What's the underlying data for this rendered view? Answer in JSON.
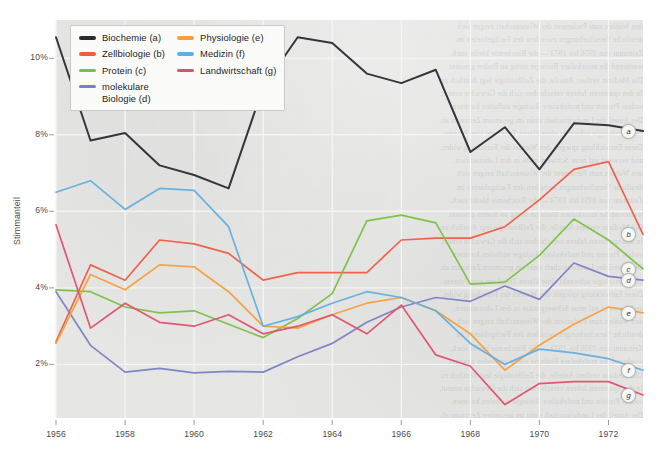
{
  "chart_data": {
    "type": "line",
    "title": "",
    "xlabel": "",
    "ylabel": "Stimmanteil",
    "xlim": [
      1956,
      1973
    ],
    "ylim": [
      0.6,
      11.0
    ],
    "grid": true,
    "legend_position": "top-left",
    "x_tick_labels": [
      "1956",
      "1958",
      "1960",
      "1962",
      "1964",
      "1966",
      "1968",
      "1970",
      "1972"
    ],
    "x_ticks": [
      1956,
      1958,
      1960,
      1962,
      1964,
      1966,
      1968,
      1970,
      1972
    ],
    "y_tick_labels": [
      "2%",
      "4%",
      "6%",
      "8%",
      "10%"
    ],
    "y_ticks": [
      2,
      4,
      6,
      8,
      10
    ],
    "x": [
      1956,
      1957,
      1958,
      1959,
      1960,
      1961,
      1962,
      1963,
      1964,
      1965,
      1966,
      1967,
      1968,
      1969,
      1970,
      1971,
      1972,
      1973
    ],
    "series": [
      {
        "name": "Biochemie (a)",
        "key": "a",
        "color": "#2b2b33",
        "values": [
          10.55,
          7.85,
          8.05,
          7.2,
          6.95,
          6.6,
          9.25,
          10.55,
          10.4,
          9.6,
          9.35,
          9.7,
          7.55,
          8.2,
          7.1,
          8.3,
          8.25,
          8.1
        ]
      },
      {
        "name": "Zellbiologie (b)",
        "key": "b",
        "color": "#ef5c45",
        "values": [
          2.6,
          4.6,
          4.2,
          5.25,
          5.15,
          4.9,
          4.2,
          4.4,
          4.4,
          4.4,
          5.25,
          5.3,
          5.3,
          5.6,
          6.3,
          7.1,
          7.3,
          5.4
        ]
      },
      {
        "name": "Protein (c)",
        "key": "c",
        "color": "#7bc043",
        "values": [
          3.95,
          3.9,
          3.5,
          3.35,
          3.4,
          3.05,
          2.7,
          3.2,
          3.85,
          5.75,
          5.9,
          5.7,
          4.1,
          4.15,
          4.85,
          5.8,
          5.25,
          4.5
        ]
      },
      {
        "name": "molekulare\nBiologie (d)",
        "key": "d",
        "color": "#7b7fc4",
        "values": [
          3.9,
          2.5,
          1.8,
          1.9,
          1.78,
          1.82,
          1.8,
          2.2,
          2.55,
          3.1,
          3.5,
          3.75,
          3.65,
          4.05,
          3.7,
          4.65,
          4.3,
          4.2
        ]
      },
      {
        "name": "Physiologie (e)",
        "key": "e",
        "color": "#f5a03c",
        "values": [
          2.55,
          4.35,
          3.95,
          4.6,
          4.55,
          3.9,
          3.0,
          2.95,
          3.3,
          3.6,
          3.75,
          3.4,
          2.8,
          1.85,
          2.5,
          3.05,
          3.5,
          3.35
        ]
      },
      {
        "name": "Medizin (f)",
        "key": "f",
        "color": "#62aee0",
        "values": [
          6.5,
          6.8,
          6.05,
          6.6,
          6.55,
          5.6,
          3.0,
          3.25,
          3.6,
          3.9,
          3.75,
          3.4,
          2.55,
          2.0,
          2.4,
          2.3,
          2.15,
          1.85
        ]
      },
      {
        "name": "Landwirtschaft (g)",
        "key": "g",
        "color": "#e0506b"
      }
    ]
  },
  "series_g_values": [
    5.65,
    2.95,
    3.6,
    3.1,
    3.0,
    3.3,
    2.8,
    3.0,
    3.3,
    2.8,
    3.55,
    2.25,
    1.95,
    0.95,
    1.5,
    1.55,
    1.55,
    1.2
  ],
  "legend": {
    "column_1": [
      {
        "label": "Biochemie (a)",
        "color": "#2b2b33"
      },
      {
        "label": "Zellbiologie (b)",
        "color": "#ef5c45"
      },
      {
        "label": "Protein (c)",
        "color": "#7bc043"
      },
      {
        "label": "molekulare\nBiologie (d)",
        "color": "#7b7fc4"
      }
    ],
    "column_2": [
      {
        "label": "Physiologie (e)",
        "color": "#f5a03c"
      },
      {
        "label": "Medizin (f)",
        "color": "#62aee0"
      },
      {
        "label": "Landwirtschaft (g)",
        "color": "#e0506b"
      }
    ]
  },
  "end_labels": [
    {
      "key": "a",
      "text": "a"
    },
    {
      "key": "b",
      "text": "b"
    },
    {
      "key": "c",
      "text": "c"
    },
    {
      "key": "d",
      "text": "d"
    },
    {
      "key": "e",
      "text": "e"
    },
    {
      "key": "f",
      "text": "f"
    },
    {
      "key": "g",
      "text": "g"
    }
  ],
  "colors": {
    "plot_background": "#e9e9e7",
    "gridline": "#f6f6f5",
    "page_background": "#ffffff",
    "axis_text": "#4a4a4a"
  },
  "ghost_lines": [
    "den Wahlen zum Parlament der Wissenschaft zeigen sich",
    "deutliche Verschiebungen zwischen den Fachgebieten im",
    "Zeitraum von 1956 bis 1973 — die Biochemie bleibt stark,",
    "waehrend die molekulare Biologie stetig an Boden gewinnt.",
    "Die Medizin verliert Anteile, die Zellbiologie legt deutlich zu.",
    "In den spaeteren Jahren verschieben sich die Gewichte erneut,",
    "sodass Protein und molekulare Biologie aufholen koennen.",
    "Der Anteil der Landwirtschaft sinkt im gesamten Zeitraum ab,",
    "die Physiologie schwankt ohne klaren Trend um vier Prozent.",
    "Diese Entwicklung spiegelt den Wandel der Forschung wider,",
    "und verweist auf neue Schwerpunkte in den Laboratorien."
  ]
}
